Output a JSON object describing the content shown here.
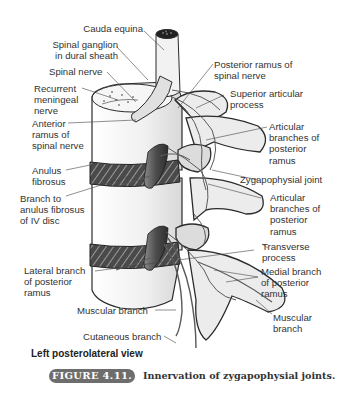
{
  "figure": {
    "view": "Left posterolateral view",
    "badge": "FIGURE 4.11.",
    "title": "Innervation of zygapophysial joints."
  },
  "labels": {
    "cauda_equina": "Cauda equina",
    "spinal_ganglion": [
      "Spinal ganglion",
      "in dural sheath"
    ],
    "spinal_nerve": "Spinal nerve",
    "recurrent_meningeal": [
      "Recurrent",
      "meningeal",
      "nerve"
    ],
    "anterior_ramus": [
      "Anterior",
      "ramus of",
      "spinal nerve"
    ],
    "anulus_fibrosus": [
      "Anulus",
      "fibrosus"
    ],
    "branch_to_anulus": [
      "Branch to",
      "anulus fibrosus",
      "of IV disc"
    ],
    "lateral_branch": [
      "Lateral branch",
      "of posterior",
      "ramus"
    ],
    "muscular_branch_left": "Muscular branch",
    "cutaneous_branch": "Cutaneous branch",
    "posterior_ramus": [
      "Posterior ramus of",
      "spinal nerve"
    ],
    "superior_articular": [
      "Superior articular",
      "process"
    ],
    "articular_branches_upper": [
      "Articular",
      "branches of",
      "posterior",
      "ramus"
    ],
    "zygapophysial_joint": "Zygapophysial joint",
    "articular_branches_lower": [
      "Articular",
      "branches of",
      "posterior",
      "ramus"
    ],
    "transverse_process": [
      "Transverse",
      "process"
    ],
    "medial_branch": [
      "Medial branch",
      "of posterior",
      "ramus"
    ],
    "muscular_branch_right": [
      "Muscular",
      "branch"
    ]
  },
  "colors": {
    "bone_fill": "#e9e9e9",
    "bone_stroke": "#2b2b2b",
    "disc_dark": "#3a3a3a",
    "nerve": "#5a5a5a",
    "ganglion": "#555555",
    "leader": "#444444",
    "badge_bg": "#6d6d6d"
  }
}
